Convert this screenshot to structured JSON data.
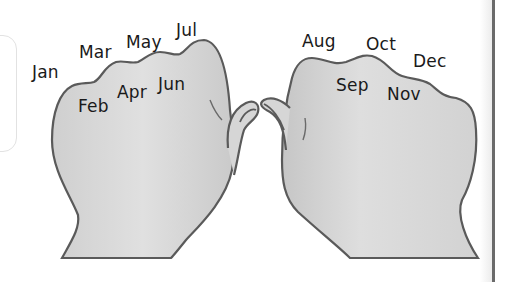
{
  "diagram": {
    "left_fist": {
      "knuckle_months": [
        "Jan",
        "Mar",
        "May",
        "Jul"
      ],
      "gap_months": [
        "Feb",
        "Apr",
        "Jun"
      ]
    },
    "right_fist": {
      "knuckle_months": [
        "Aug",
        "Oct",
        "Dec"
      ],
      "gap_months": [
        "Sep",
        "Nov"
      ]
    },
    "labels": {
      "jan": "Jan",
      "feb": "Feb",
      "mar": "Mar",
      "apr": "Apr",
      "may": "May",
      "jun": "Jun",
      "jul": "Jul",
      "aug": "Aug",
      "sep": "Sep",
      "oct": "Oct",
      "nov": "Nov",
      "dec": "Dec"
    },
    "colors": {
      "hand_fill": "#d9d9d9",
      "hand_outline": "#5a5a5a",
      "text": "#1a1a1a"
    }
  }
}
